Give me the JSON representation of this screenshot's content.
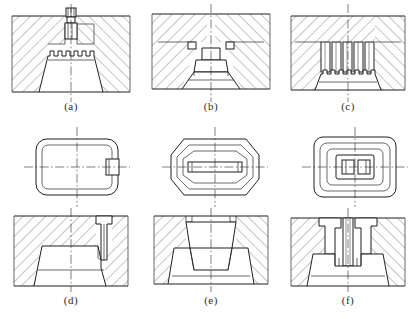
{
  "figure": {
    "title": "",
    "layout": {
      "rows": 3,
      "columns": 3,
      "width": 415,
      "height": 319
    },
    "background_color": "#ffffff",
    "line_color": "#1f1f1f",
    "panels": [
      {
        "id": "a",
        "caption": "(a)",
        "view": "section",
        "row": 1,
        "column": 1,
        "description": "sectioned die cavity with central punch and serrated top part profile"
      },
      {
        "id": "b",
        "caption": "(b)",
        "view": "section",
        "row": 1,
        "column": 2,
        "description": "sectioned die with stepped central core and tapered part"
      },
      {
        "id": "c",
        "caption": "(c)",
        "view": "section",
        "row": 1,
        "column": 3,
        "description": "sectioned die with multiple ejector pins over serrated part"
      },
      {
        "id": "d",
        "caption": "(d)",
        "view": "section",
        "row": 3,
        "column": 1,
        "description": "sectioned die with offset side gate and tapered part"
      },
      {
        "id": "e",
        "caption": "(e)",
        "view": "section",
        "row": 3,
        "column": 2,
        "description": "sectioned die with wide central cavity and flanged tapered part"
      },
      {
        "id": "f",
        "caption": "(f)",
        "view": "section",
        "row": 3,
        "column": 3,
        "description": "sectioned die with twin cores and split tapered part"
      },
      {
        "id": "plan-d",
        "caption": "",
        "view": "plan",
        "row": 2,
        "column": 1,
        "description": "rounded rectangular plan outline with small side boss"
      },
      {
        "id": "plan-e",
        "caption": "",
        "view": "plan",
        "row": 2,
        "column": 2,
        "description": "octagonal oval plan outline with central slot"
      },
      {
        "id": "plan-f",
        "caption": "",
        "view": "plan",
        "row": 2,
        "column": 3,
        "description": "nested rounded rectangular plan outline with central twin boss"
      }
    ]
  }
}
